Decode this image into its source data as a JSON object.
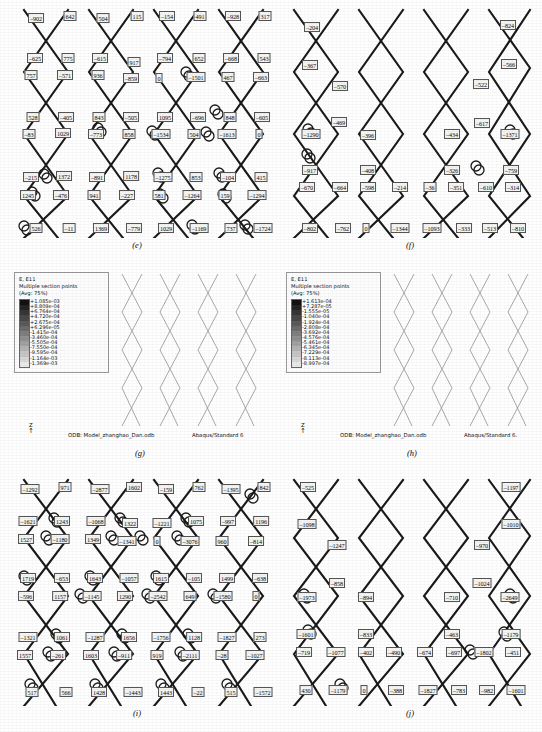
{
  "figure": {
    "captions": {
      "e": "(e)",
      "f": "(f)",
      "g": "(g)",
      "h": "(h)",
      "i": "(i)",
      "j": "(j)"
    }
  },
  "panel_e": {
    "caption": "(e)",
    "values": [
      {
        "x": 36,
        "y": 18,
        "t": "–902"
      },
      {
        "x": 70,
        "y": 16,
        "t": "642"
      },
      {
        "x": 103,
        "y": 18,
        "t": "504"
      },
      {
        "x": 137,
        "y": 16,
        "t": "115"
      },
      {
        "x": 167,
        "y": 16,
        "t": "–154"
      },
      {
        "x": 200,
        "y": 16,
        "t": "491"
      },
      {
        "x": 233,
        "y": 16,
        "t": "–928"
      },
      {
        "x": 265,
        "y": 16,
        "t": "317"
      },
      {
        "x": 35,
        "y": 58,
        "t": "–625"
      },
      {
        "x": 68,
        "y": 58,
        "t": "775"
      },
      {
        "x": 100,
        "y": 58,
        "t": "–615"
      },
      {
        "x": 134,
        "y": 62,
        "t": "917"
      },
      {
        "x": 165,
        "y": 58,
        "t": "–794"
      },
      {
        "x": 199,
        "y": 58,
        "t": "652"
      },
      {
        "x": 231,
        "y": 58,
        "t": "–668"
      },
      {
        "x": 264,
        "y": 58,
        "t": "543"
      },
      {
        "x": 31,
        "y": 75,
        "t": "757"
      },
      {
        "x": 65,
        "y": 75,
        "t": "–571"
      },
      {
        "x": 98,
        "y": 75,
        "t": "936"
      },
      {
        "x": 131,
        "y": 78,
        "t": "–859"
      },
      {
        "x": 159,
        "y": 78,
        "t": "0"
      },
      {
        "x": 196,
        "y": 77,
        "t": "–1501"
      },
      {
        "x": 228,
        "y": 77,
        "t": "467"
      },
      {
        "x": 261,
        "y": 77,
        "t": "–663"
      },
      {
        "x": 33,
        "y": 117,
        "t": "528"
      },
      {
        "x": 66,
        "y": 117,
        "t": "–405"
      },
      {
        "x": 99,
        "y": 117,
        "t": "843"
      },
      {
        "x": 131,
        "y": 117,
        "t": "–505"
      },
      {
        "x": 165,
        "y": 117,
        "t": "1095"
      },
      {
        "x": 198,
        "y": 117,
        "t": "–696"
      },
      {
        "x": 230,
        "y": 117,
        "t": "848"
      },
      {
        "x": 262,
        "y": 117,
        "t": "–605"
      },
      {
        "x": 29,
        "y": 134,
        "t": "–83"
      },
      {
        "x": 63,
        "y": 133,
        "t": "1029"
      },
      {
        "x": 96,
        "y": 134,
        "t": "–773"
      },
      {
        "x": 129,
        "y": 134,
        "t": "858"
      },
      {
        "x": 161,
        "y": 134,
        "t": "–1534"
      },
      {
        "x": 194,
        "y": 134,
        "t": "504"
      },
      {
        "x": 227,
        "y": 134,
        "t": "–1613"
      },
      {
        "x": 259,
        "y": 134,
        "t": "0"
      },
      {
        "x": 31,
        "y": 177,
        "t": "–215"
      },
      {
        "x": 64,
        "y": 176,
        "t": "1372"
      },
      {
        "x": 97,
        "y": 177,
        "t": "–891"
      },
      {
        "x": 131,
        "y": 176,
        "t": "1178"
      },
      {
        "x": 163,
        "y": 177,
        "t": "–1275"
      },
      {
        "x": 196,
        "y": 177,
        "t": "853"
      },
      {
        "x": 228,
        "y": 177,
        "t": "–104"
      },
      {
        "x": 261,
        "y": 177,
        "t": "415"
      },
      {
        "x": 28,
        "y": 195,
        "t": "1245"
      },
      {
        "x": 61,
        "y": 195,
        "t": "–476"
      },
      {
        "x": 94,
        "y": 195,
        "t": "941"
      },
      {
        "x": 127,
        "y": 195,
        "t": "–227"
      },
      {
        "x": 159,
        "y": 195,
        "t": "581"
      },
      {
        "x": 192,
        "y": 195,
        "t": "–1264"
      },
      {
        "x": 225,
        "y": 195,
        "t": "159"
      },
      {
        "x": 257,
        "y": 195,
        "t": "–1294"
      },
      {
        "x": 36,
        "y": 228,
        "t": "526"
      },
      {
        "x": 69,
        "y": 228,
        "t": "–11"
      },
      {
        "x": 101,
        "y": 228,
        "t": "1369"
      },
      {
        "x": 134,
        "y": 228,
        "t": "–779"
      },
      {
        "x": 166,
        "y": 228,
        "t": "1029"
      },
      {
        "x": 199,
        "y": 228,
        "t": "–1169"
      },
      {
        "x": 231,
        "y": 228,
        "t": "737"
      },
      {
        "x": 263,
        "y": 228,
        "t": "–1724"
      }
    ]
  },
  "panel_f": {
    "caption": "(f)",
    "values": [
      {
        "x": 312,
        "y": 27,
        "t": "–204"
      },
      {
        "x": 508,
        "y": 25,
        "t": "–824"
      },
      {
        "x": 310,
        "y": 65,
        "t": "–367"
      },
      {
        "x": 509,
        "y": 64,
        "t": "–566"
      },
      {
        "x": 340,
        "y": 86,
        "t": "–570"
      },
      {
        "x": 481,
        "y": 84,
        "t": "–522"
      },
      {
        "x": 339,
        "y": 122,
        "t": "–469"
      },
      {
        "x": 482,
        "y": 123,
        "t": "–617"
      },
      {
        "x": 311,
        "y": 134,
        "t": "–1290"
      },
      {
        "x": 368,
        "y": 135,
        "t": "–396"
      },
      {
        "x": 452,
        "y": 134,
        "t": "–434"
      },
      {
        "x": 510,
        "y": 134,
        "t": "–1371"
      },
      {
        "x": 310,
        "y": 170,
        "t": "–917"
      },
      {
        "x": 368,
        "y": 170,
        "t": "–408"
      },
      {
        "x": 452,
        "y": 170,
        "t": "–326"
      },
      {
        "x": 511,
        "y": 170,
        "t": "–759"
      },
      {
        "x": 307,
        "y": 187,
        "t": "–670"
      },
      {
        "x": 340,
        "y": 187,
        "t": "–664"
      },
      {
        "x": 368,
        "y": 187,
        "t": "–598"
      },
      {
        "x": 400,
        "y": 187,
        "t": "–214"
      },
      {
        "x": 430,
        "y": 187,
        "t": "–36"
      },
      {
        "x": 456,
        "y": 187,
        "t": "–351"
      },
      {
        "x": 486,
        "y": 187,
        "t": "–610"
      },
      {
        "x": 513,
        "y": 187,
        "t": "–314"
      },
      {
        "x": 310,
        "y": 228,
        "t": "–802"
      },
      {
        "x": 343,
        "y": 228,
        "t": "–762"
      },
      {
        "x": 366,
        "y": 228,
        "t": "0"
      },
      {
        "x": 400,
        "y": 228,
        "t": "–1344"
      },
      {
        "x": 432,
        "y": 228,
        "t": "–1093"
      },
      {
        "x": 464,
        "y": 228,
        "t": "–333"
      },
      {
        "x": 490,
        "y": 228,
        "t": "–513"
      },
      {
        "x": 518,
        "y": 228,
        "t": "–810"
      }
    ]
  },
  "panel_g": {
    "caption": "(g)",
    "legend": {
      "title_lines": [
        "E, E11",
        "Multiple section points",
        "(Avg: 75%)"
      ],
      "values": [
        "+1.085e-03",
        "+8.809e-04",
        "+6.764e-04",
        "+4.720e-04",
        "+2.675e-04",
        "+6.296e-05",
        "-1.415e-04",
        "-3.460e-04",
        "-5.505e-04",
        "-7.550e-04",
        "-9.595e-04",
        "-1.164e-03",
        "-1.369e-03"
      ]
    },
    "odb_label": "ODB: Model_zhanghao_Dan.odb",
    "product_label": "Abaqus/Standard 6",
    "axis_label": "Z"
  },
  "panel_h": {
    "caption": "(h)",
    "legend": {
      "title_lines": [
        "E, E11",
        "Multiple section points",
        "(Avg: 75%)"
      ],
      "values": [
        "+1.613e-04",
        "+7.287e-05",
        "-1.555e-05",
        "-1.040e-04",
        "-1.924e-04",
        "-2.808e-04",
        "-3.692e-04",
        "-4.576e-04",
        "-5.461e-04",
        "-6.345e-04",
        "-7.229e-04",
        "-8.113e-04",
        "-8.997e-04"
      ]
    },
    "odb_label": "ODB: Model_zhanghao_Dan.odb",
    "product_label": "Abaqus/Standard 6.",
    "axis_label": "Z"
  },
  "panel_i": {
    "caption": "(i)",
    "values": [
      {
        "x": 30,
        "y": 489,
        "t": "–1292"
      },
      {
        "x": 65,
        "y": 487,
        "t": "971"
      },
      {
        "x": 100,
        "y": 489,
        "t": "–2877"
      },
      {
        "x": 134,
        "y": 487,
        "t": "1602"
      },
      {
        "x": 166,
        "y": 489,
        "t": "–159"
      },
      {
        "x": 199,
        "y": 487,
        "t": "762"
      },
      {
        "x": 231,
        "y": 489,
        "t": "–1395"
      },
      {
        "x": 264,
        "y": 487,
        "t": "842"
      },
      {
        "x": 28,
        "y": 521,
        "t": "–1621"
      },
      {
        "x": 62,
        "y": 521,
        "t": "1243"
      },
      {
        "x": 96,
        "y": 521,
        "t": "–1068"
      },
      {
        "x": 130,
        "y": 523,
        "t": "1322"
      },
      {
        "x": 162,
        "y": 523,
        "t": "–1221"
      },
      {
        "x": 196,
        "y": 521,
        "t": "1075"
      },
      {
        "x": 228,
        "y": 521,
        "t": "–997"
      },
      {
        "x": 261,
        "y": 521,
        "t": "1196"
      },
      {
        "x": 26,
        "y": 539,
        "t": "1527"
      },
      {
        "x": 60,
        "y": 539,
        "t": "–1180"
      },
      {
        "x": 93,
        "y": 539,
        "t": "1349"
      },
      {
        "x": 127,
        "y": 541,
        "t": "–1341"
      },
      {
        "x": 157,
        "y": 541,
        "t": "0"
      },
      {
        "x": 190,
        "y": 541,
        "t": "–3076"
      },
      {
        "x": 222,
        "y": 541,
        "t": "960"
      },
      {
        "x": 256,
        "y": 541,
        "t": "–814"
      },
      {
        "x": 28,
        "y": 578,
        "t": "1719"
      },
      {
        "x": 62,
        "y": 578,
        "t": "–653"
      },
      {
        "x": 95,
        "y": 578,
        "t": "1643"
      },
      {
        "x": 129,
        "y": 578,
        "t": "–1057"
      },
      {
        "x": 161,
        "y": 578,
        "t": "1615"
      },
      {
        "x": 194,
        "y": 578,
        "t": "–105"
      },
      {
        "x": 227,
        "y": 578,
        "t": "1499"
      },
      {
        "x": 260,
        "y": 578,
        "t": "–638"
      },
      {
        "x": 26,
        "y": 596,
        "t": "–596"
      },
      {
        "x": 60,
        "y": 596,
        "t": "1157"
      },
      {
        "x": 92,
        "y": 596,
        "t": "–1145"
      },
      {
        "x": 125,
        "y": 596,
        "t": "1290"
      },
      {
        "x": 158,
        "y": 596,
        "t": "–2542"
      },
      {
        "x": 190,
        "y": 596,
        "t": "649"
      },
      {
        "x": 223,
        "y": 596,
        "t": "–1580"
      },
      {
        "x": 256,
        "y": 596,
        "t": "0"
      },
      {
        "x": 28,
        "y": 637,
        "t": "–1321"
      },
      {
        "x": 62,
        "y": 637,
        "t": "1061"
      },
      {
        "x": 95,
        "y": 637,
        "t": "–1287"
      },
      {
        "x": 129,
        "y": 637,
        "t": "1656"
      },
      {
        "x": 161,
        "y": 637,
        "t": "–1756"
      },
      {
        "x": 194,
        "y": 637,
        "t": "1128"
      },
      {
        "x": 227,
        "y": 637,
        "t": "–1827"
      },
      {
        "x": 260,
        "y": 637,
        "t": "273"
      },
      {
        "x": 25,
        "y": 655,
        "t": "1557"
      },
      {
        "x": 58,
        "y": 655,
        "t": "–261"
      },
      {
        "x": 91,
        "y": 655,
        "t": "1603"
      },
      {
        "x": 124,
        "y": 655,
        "t": "–911"
      },
      {
        "x": 157,
        "y": 655,
        "t": "919"
      },
      {
        "x": 190,
        "y": 655,
        "t": "–2111"
      },
      {
        "x": 222,
        "y": 655,
        "t": "–28"
      },
      {
        "x": 255,
        "y": 655,
        "t": "–1027"
      },
      {
        "x": 32,
        "y": 692,
        "t": "517"
      },
      {
        "x": 66,
        "y": 692,
        "t": "566"
      },
      {
        "x": 99,
        "y": 692,
        "t": "1428"
      },
      {
        "x": 133,
        "y": 692,
        "t": "–1443"
      },
      {
        "x": 166,
        "y": 692,
        "t": "1443"
      },
      {
        "x": 198,
        "y": 692,
        "t": "–22"
      },
      {
        "x": 231,
        "y": 692,
        "t": "515"
      },
      {
        "x": 263,
        "y": 692,
        "t": "–1572"
      }
    ]
  },
  "panel_j": {
    "caption": "(j)",
    "values": [
      {
        "x": 308,
        "y": 487,
        "t": "–525"
      },
      {
        "x": 511,
        "y": 487,
        "t": "–1197"
      },
      {
        "x": 307,
        "y": 524,
        "t": "–1098"
      },
      {
        "x": 511,
        "y": 524,
        "t": "–1010"
      },
      {
        "x": 337,
        "y": 545,
        "t": "–1247"
      },
      {
        "x": 482,
        "y": 545,
        "t": "–970"
      },
      {
        "x": 337,
        "y": 583,
        "t": "–858"
      },
      {
        "x": 482,
        "y": 583,
        "t": "–1024"
      },
      {
        "x": 307,
        "y": 597,
        "t": "–1973"
      },
      {
        "x": 366,
        "y": 597,
        "t": "–894"
      },
      {
        "x": 452,
        "y": 597,
        "t": "–710"
      },
      {
        "x": 510,
        "y": 597,
        "t": "–2649"
      },
      {
        "x": 306,
        "y": 634,
        "t": "–1601"
      },
      {
        "x": 366,
        "y": 634,
        "t": "–833"
      },
      {
        "x": 452,
        "y": 634,
        "t": "–463"
      },
      {
        "x": 511,
        "y": 634,
        "t": "–1179"
      },
      {
        "x": 304,
        "y": 652,
        "t": "–719"
      },
      {
        "x": 336,
        "y": 652,
        "t": "–1077"
      },
      {
        "x": 366,
        "y": 652,
        "t": "–402"
      },
      {
        "x": 394,
        "y": 652,
        "t": "–490"
      },
      {
        "x": 425,
        "y": 652,
        "t": "–674"
      },
      {
        "x": 454,
        "y": 652,
        "t": "–697"
      },
      {
        "x": 484,
        "y": 652,
        "t": "–1802"
      },
      {
        "x": 513,
        "y": 652,
        "t": "–451"
      },
      {
        "x": 306,
        "y": 690,
        "t": "430"
      },
      {
        "x": 338,
        "y": 690,
        "t": "–1179"
      },
      {
        "x": 364,
        "y": 690,
        "t": "0"
      },
      {
        "x": 396,
        "y": 690,
        "t": "–388"
      },
      {
        "x": 428,
        "y": 690,
        "t": "–1827"
      },
      {
        "x": 459,
        "y": 690,
        "t": "–783"
      },
      {
        "x": 487,
        "y": 690,
        "t": "–982"
      },
      {
        "x": 516,
        "y": 690,
        "t": "–1601"
      }
    ]
  }
}
